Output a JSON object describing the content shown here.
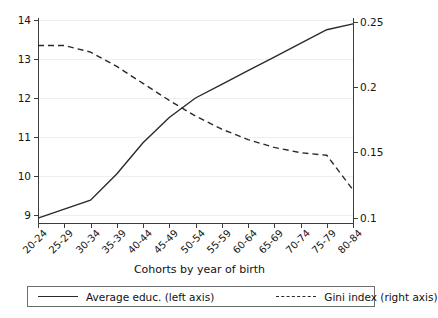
{
  "chart_data": {
    "type": "line",
    "title": "",
    "subtitle": "",
    "xlabel": "Cohorts by year of birth",
    "ylabel": "",
    "grid": true,
    "legend_position": "bottom",
    "categories": [
      "20-24",
      "25-29",
      "30-34",
      "35-39",
      "40-44",
      "45-49",
      "50-54",
      "55-59",
      "60-64",
      "65-69",
      "70-74",
      "75-79",
      "80-84"
    ],
    "axes": {
      "left": {
        "label": "Average educ. (left axis)",
        "ticks": [
          "9",
          "10",
          "11",
          "12",
          "13",
          "14"
        ],
        "tick_values": [
          9,
          10,
          11,
          12,
          13,
          14
        ],
        "ylim": [
          8.78,
          14.0
        ]
      },
      "right": {
        "label": "Gini index (right axis)",
        "ticks": [
          "0.1",
          "0.15",
          "0.2",
          "0.25"
        ],
        "tick_values": [
          0.1,
          0.15,
          0.2,
          0.25
        ],
        "ylim": [
          0.0862,
          0.2554
        ]
      }
    },
    "series": [
      {
        "name": "Average educ. (left axis)",
        "axis": "left",
        "style": "solid",
        "color": "#2a2a2a",
        "values": [
          8.92,
          9.15,
          9.38,
          10.05,
          10.85,
          11.5,
          12.0,
          12.35,
          12.7,
          13.05,
          13.4,
          13.75,
          13.9
        ]
      },
      {
        "name": "Gini index (right axis)",
        "axis": "right",
        "style": "dashed",
        "color": "#2a2a2a",
        "values": [
          0.232,
          0.232,
          0.227,
          0.216,
          0.203,
          0.19,
          0.178,
          0.168,
          0.16,
          0.154,
          0.15,
          0.148,
          0.1215
        ]
      }
    ]
  },
  "legend": {
    "entries": [
      {
        "label": "Average educ. (left axis)",
        "style": "solid"
      },
      {
        "label": "Gini index (right axis)",
        "style": "dashed"
      }
    ]
  }
}
